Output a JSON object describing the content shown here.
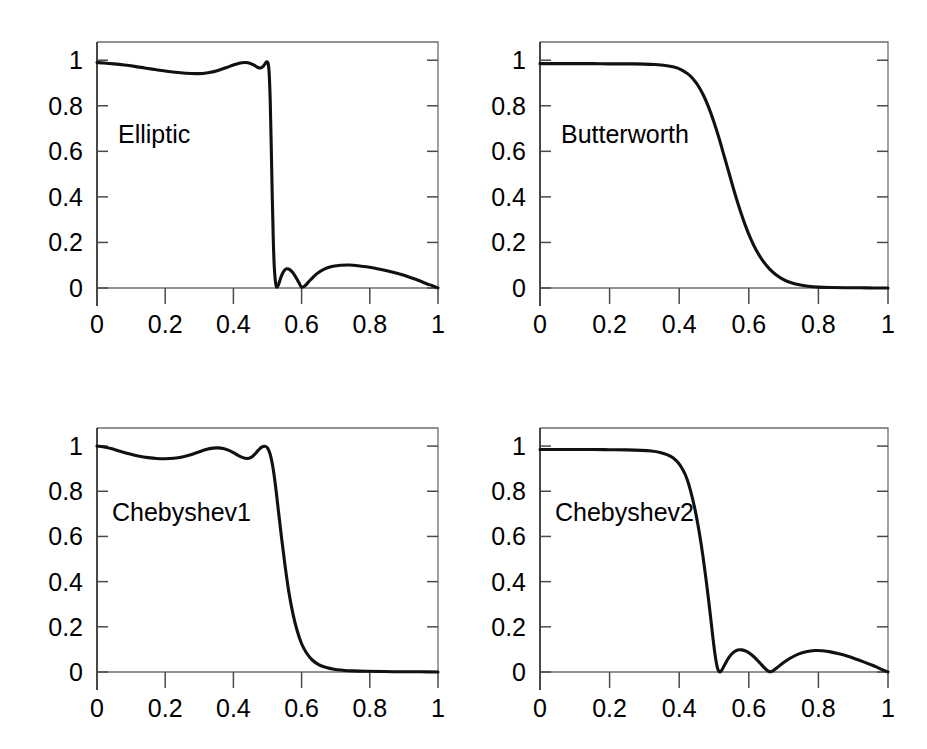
{
  "figure": {
    "background_color": "#ffffff",
    "curve_color": "#111111",
    "axis_color": "#1a1a1a",
    "width": 927,
    "height": 749,
    "rows": 2,
    "cols": 2
  },
  "chart_data": [
    {
      "type": "line",
      "title": "",
      "annotation": "Elliptic",
      "xlabel": "",
      "ylabel": "",
      "xlim": [
        0,
        1
      ],
      "ylim": [
        0,
        1.08
      ],
      "grid": false,
      "legend": null,
      "xticks": [
        0,
        0.2,
        0.4,
        0.6,
        0.8,
        1
      ],
      "xticklabels": [
        "0",
        "0.2",
        "0.4",
        "0.6",
        "0.8",
        "1"
      ],
      "yticks": [
        0,
        0.2,
        0.4,
        0.6,
        0.8,
        1
      ],
      "yticklabels": [
        "0",
        "0.2",
        "0.4",
        "0.6",
        "0.8",
        "1"
      ],
      "series": [
        {
          "name": "Elliptic magnitude response",
          "x": [
            0.0,
            0.02,
            0.05,
            0.08,
            0.11,
            0.14,
            0.17,
            0.2,
            0.23,
            0.26,
            0.29,
            0.31,
            0.33,
            0.355,
            0.38,
            0.4,
            0.42,
            0.435,
            0.45,
            0.462,
            0.472,
            0.48,
            0.488,
            0.494,
            0.498,
            0.502,
            0.505,
            0.508,
            0.511,
            0.514,
            0.517,
            0.52,
            0.524,
            0.528,
            0.533,
            0.54,
            0.548,
            0.556,
            0.565,
            0.574,
            0.583,
            0.592,
            0.6,
            0.61,
            0.625,
            0.645,
            0.668,
            0.692,
            0.715,
            0.74,
            0.765,
            0.79,
            0.815,
            0.84,
            0.865,
            0.89,
            0.915,
            0.94,
            0.965,
            0.985,
            1.0
          ],
          "y": [
            0.99,
            0.988,
            0.984,
            0.979,
            0.973,
            0.966,
            0.959,
            0.953,
            0.947,
            0.943,
            0.941,
            0.942,
            0.946,
            0.955,
            0.968,
            0.979,
            0.988,
            0.99,
            0.986,
            0.977,
            0.968,
            0.966,
            0.974,
            0.987,
            0.993,
            0.985,
            0.94,
            0.82,
            0.62,
            0.4,
            0.21,
            0.09,
            0.02,
            0.003,
            0.018,
            0.05,
            0.074,
            0.084,
            0.081,
            0.068,
            0.048,
            0.024,
            0.004,
            0.01,
            0.034,
            0.063,
            0.084,
            0.095,
            0.1,
            0.101,
            0.098,
            0.093,
            0.087,
            0.079,
            0.07,
            0.06,
            0.048,
            0.035,
            0.02,
            0.009,
            0.0
          ]
        }
      ]
    },
    {
      "type": "line",
      "title": "",
      "annotation": "Butterworth",
      "xlabel": "",
      "ylabel": "",
      "xlim": [
        0,
        1
      ],
      "ylim": [
        0,
        1.08
      ],
      "grid": false,
      "legend": null,
      "xticks": [
        0,
        0.2,
        0.4,
        0.6,
        0.8,
        1
      ],
      "xticklabels": [
        "0",
        "0.2",
        "0.4",
        "0.6",
        "0.8",
        "1"
      ],
      "yticks": [
        0,
        0.2,
        0.4,
        0.6,
        0.8,
        1
      ],
      "yticklabels": [
        "0",
        "0.2",
        "0.4",
        "0.6",
        "0.8",
        "1"
      ],
      "series": [
        {
          "name": "Butterworth magnitude response",
          "x": [
            0.0,
            0.05,
            0.1,
            0.15,
            0.2,
            0.25,
            0.3,
            0.33,
            0.36,
            0.385,
            0.405,
            0.425,
            0.44,
            0.455,
            0.47,
            0.485,
            0.5,
            0.515,
            0.53,
            0.545,
            0.56,
            0.575,
            0.59,
            0.605,
            0.62,
            0.64,
            0.66,
            0.68,
            0.7,
            0.72,
            0.745,
            0.77,
            0.8,
            0.84,
            0.88,
            0.92,
            0.96,
            1.0
          ],
          "y": [
            0.985,
            0.985,
            0.985,
            0.985,
            0.984,
            0.984,
            0.983,
            0.981,
            0.977,
            0.97,
            0.959,
            0.94,
            0.918,
            0.887,
            0.845,
            0.792,
            0.728,
            0.655,
            0.575,
            0.495,
            0.415,
            0.341,
            0.275,
            0.218,
            0.17,
            0.12,
            0.083,
            0.056,
            0.037,
            0.024,
            0.014,
            0.008,
            0.004,
            0.002,
            0.001,
            0.001,
            0.0,
            0.0
          ]
        }
      ]
    },
    {
      "type": "line",
      "title": "",
      "annotation": "Chebyshev1",
      "xlabel": "",
      "ylabel": "",
      "xlim": [
        0,
        1
      ],
      "ylim": [
        0,
        1.08
      ],
      "grid": false,
      "legend": null,
      "xticks": [
        0,
        0.2,
        0.4,
        0.6,
        0.8,
        1
      ],
      "xticklabels": [
        "0",
        "0.2",
        "0.4",
        "0.6",
        "0.8",
        "1"
      ],
      "yticks": [
        0,
        0.2,
        0.4,
        0.6,
        0.8,
        1
      ],
      "yticklabels": [
        "0",
        "0.2",
        "0.4",
        "0.6",
        "0.8",
        "1"
      ],
      "series": [
        {
          "name": "Chebyshev Type I magnitude response",
          "x": [
            0.0,
            0.025,
            0.05,
            0.075,
            0.1,
            0.125,
            0.15,
            0.175,
            0.2,
            0.225,
            0.25,
            0.275,
            0.3,
            0.32,
            0.34,
            0.355,
            0.37,
            0.385,
            0.4,
            0.415,
            0.428,
            0.44,
            0.452,
            0.462,
            0.472,
            0.482,
            0.492,
            0.5,
            0.508,
            0.516,
            0.524,
            0.532,
            0.542,
            0.552,
            0.562,
            0.574,
            0.586,
            0.6,
            0.615,
            0.632,
            0.65,
            0.67,
            0.695,
            0.72,
            0.75,
            0.79,
            0.84,
            0.9,
            0.95,
            1.0
          ],
          "y": [
            1.0,
            0.995,
            0.985,
            0.974,
            0.964,
            0.955,
            0.949,
            0.945,
            0.944,
            0.946,
            0.952,
            0.962,
            0.975,
            0.985,
            0.991,
            0.992,
            0.989,
            0.982,
            0.971,
            0.958,
            0.949,
            0.945,
            0.95,
            0.963,
            0.98,
            0.994,
            0.999,
            0.992,
            0.963,
            0.905,
            0.818,
            0.713,
            0.585,
            0.465,
            0.36,
            0.262,
            0.188,
            0.125,
            0.083,
            0.052,
            0.033,
            0.021,
            0.012,
            0.008,
            0.005,
            0.003,
            0.002,
            0.001,
            0.001,
            0.0
          ]
        }
      ]
    },
    {
      "type": "line",
      "title": "",
      "annotation": "Chebyshev2",
      "xlabel": "",
      "ylabel": "",
      "xlim": [
        0,
        1
      ],
      "ylim": [
        0,
        1.08
      ],
      "grid": false,
      "legend": null,
      "xticks": [
        0,
        0.2,
        0.4,
        0.6,
        0.8,
        1
      ],
      "xticklabels": [
        "0",
        "0.2",
        "0.4",
        "0.6",
        "0.8",
        "1"
      ],
      "yticks": [
        0,
        0.2,
        0.4,
        0.6,
        0.8,
        1
      ],
      "yticklabels": [
        "0",
        "0.2",
        "0.4",
        "0.6",
        "0.8",
        "1"
      ],
      "series": [
        {
          "name": "Chebyshev Type II magnitude response",
          "x": [
            0.0,
            0.05,
            0.1,
            0.15,
            0.2,
            0.25,
            0.29,
            0.32,
            0.345,
            0.365,
            0.382,
            0.396,
            0.408,
            0.418,
            0.428,
            0.438,
            0.448,
            0.458,
            0.468,
            0.478,
            0.488,
            0.497,
            0.505,
            0.512,
            0.52,
            0.53,
            0.542,
            0.555,
            0.568,
            0.58,
            0.592,
            0.605,
            0.618,
            0.632,
            0.645,
            0.655,
            0.665,
            0.68,
            0.7,
            0.72,
            0.742,
            0.765,
            0.79,
            0.812,
            0.835,
            0.858,
            0.88,
            0.905,
            0.93,
            0.955,
            0.978,
            1.0
          ],
          "y": [
            0.985,
            0.985,
            0.985,
            0.985,
            0.984,
            0.983,
            0.981,
            0.978,
            0.972,
            0.962,
            0.948,
            0.928,
            0.902,
            0.872,
            0.828,
            0.77,
            0.7,
            0.615,
            0.515,
            0.4,
            0.272,
            0.15,
            0.056,
            0.008,
            0.003,
            0.03,
            0.063,
            0.086,
            0.097,
            0.098,
            0.092,
            0.08,
            0.063,
            0.04,
            0.018,
            0.005,
            0.002,
            0.018,
            0.042,
            0.062,
            0.079,
            0.09,
            0.095,
            0.094,
            0.089,
            0.081,
            0.072,
            0.059,
            0.045,
            0.03,
            0.014,
            0.0
          ]
        }
      ]
    }
  ]
}
